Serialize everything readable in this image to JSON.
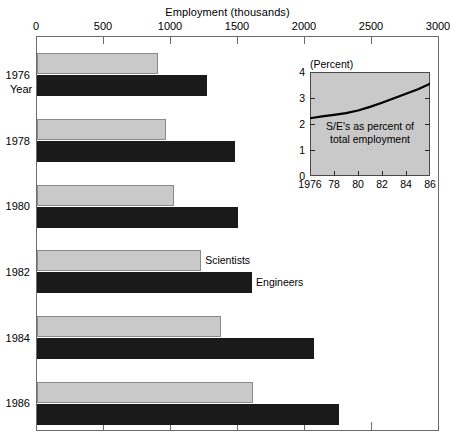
{
  "chart_data": {
    "type": "bar",
    "orientation": "horizontal",
    "title": "Employment (thousands)",
    "xlabel": "Employment (thousands)",
    "ylabel": "Year",
    "xlim": [
      0,
      3000
    ],
    "xticks": [
      0,
      500,
      1000,
      1500,
      2000,
      2500,
      3000
    ],
    "xtick_labels": [
      "0",
      "500",
      "1000",
      "1500",
      "2000",
      "2500",
      "3000"
    ],
    "categories": [
      "1976",
      "1978",
      "1980",
      "1982",
      "1984",
      "1986"
    ],
    "grid": false,
    "legend_position": "inline-annotation",
    "series": [
      {
        "name": "Scientists",
        "color": "#c9c9c9",
        "values": [
          900,
          960,
          1020,
          1225,
          1370,
          1610
        ]
      },
      {
        "name": "Engineers",
        "color": "#1a1a1a",
        "values": [
          1270,
          1475,
          1500,
          1605,
          2070,
          2250
        ]
      }
    ],
    "annotations": [
      {
        "text": "Scientists",
        "year": "1982",
        "series": "Scientists"
      },
      {
        "text": "Engineers",
        "year": "1982",
        "series": "Engineers"
      }
    ],
    "inset": {
      "type": "line",
      "title": "(Percent)",
      "caption_line1": "S/E's as percent of",
      "caption_line2": "total employment",
      "xlim": [
        1976,
        1986
      ],
      "ylim": [
        0,
        4
      ],
      "yticks": [
        0,
        1,
        2,
        3,
        4
      ],
      "ytick_labels": [
        "0",
        "1",
        "2",
        "3",
        "4"
      ],
      "xticks": [
        1976,
        1978,
        1980,
        1982,
        1984,
        1986
      ],
      "xtick_labels": [
        "1976",
        "78",
        "80",
        "82",
        "84",
        "86"
      ],
      "background": "#c9c9c9",
      "line_color": "#000000",
      "x": [
        1976,
        1977,
        1978,
        1979,
        1980,
        1981,
        1982,
        1983,
        1984,
        1985,
        1986
      ],
      "values": [
        2.22,
        2.29,
        2.35,
        2.42,
        2.52,
        2.66,
        2.82,
        2.99,
        3.16,
        3.34,
        3.55
      ]
    }
  },
  "figure": {
    "title": "Employment (thousands)",
    "year_axis_label": "Year"
  }
}
